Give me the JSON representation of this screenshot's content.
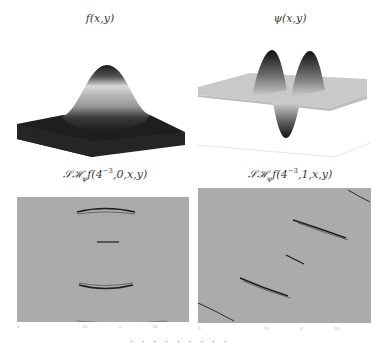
{
  "figure": {
    "panels": [
      {
        "id": "top-left",
        "title_main": "f(x,y)",
        "kind": "3d-surface",
        "description": "Gaussian bump surface, dark base, bright ring mid-height, dark peak"
      },
      {
        "id": "top-right",
        "title_main": "ψ(x,y)",
        "kind": "3d-surface",
        "description": "Shearlet/wavelet surface: two positive lobes and one negative lobe on flat light grey plane"
      },
      {
        "id": "bottom-left",
        "title_prefix": "𝒮ℋ",
        "title_sub": "ψ",
        "title_func": "f(4",
        "title_exp": "−3",
        "title_args": ",0,x,y)",
        "kind": "image",
        "description": "Shearlet coefficients at scale 4^-3, shear 0: horizontal streaks"
      },
      {
        "id": "bottom-right",
        "title_prefix": "𝒮ℋ",
        "title_sub": "ψ",
        "title_func": "f(4",
        "title_exp": "−3",
        "title_args": ",1,x,y)",
        "kind": "image",
        "description": "Shearlet coefficients at scale 4^-3, shear 1: diagonal streaks"
      }
    ],
    "tick_labels_bottom_left": [
      "0",
      "",
      "10",
      "0",
      "10",
      ""
    ],
    "tick_labels_bottom_right": [
      "0",
      "",
      "10",
      "0",
      "10",
      ""
    ],
    "colors": {
      "background": "#ffffff",
      "image_grey": "#ababab",
      "surface_dark": "#1e1e1e",
      "surface_light": "#c8c8c8",
      "streak": "#222222"
    },
    "footer_fragment": "· · · ·  · ·  · · ·"
  }
}
